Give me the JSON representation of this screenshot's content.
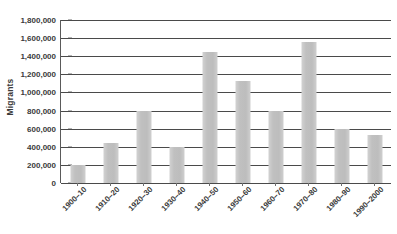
{
  "chart_data": {
    "type": "bar",
    "title": "",
    "xlabel": "",
    "ylabel": "Migrants",
    "categories": [
      "1900–10",
      "1910–20",
      "1920–30",
      "1930–40",
      "1940–50",
      "1950–60",
      "1960–70",
      "1970–80",
      "1980–90",
      "1990–2000"
    ],
    "values": [
      200000,
      440000,
      800000,
      400000,
      1450000,
      1130000,
      800000,
      1560000,
      600000,
      530000
    ],
    "ylim": [
      0,
      1800000
    ],
    "ytick_values": [
      0,
      200000,
      400000,
      600000,
      800000,
      1000000,
      1200000,
      1400000,
      1600000,
      1800000
    ],
    "ytick_labels": [
      "0",
      "200,000",
      "400,000",
      "600,000",
      "800,000",
      "1,000,000",
      "1,200,000",
      "1,400,000",
      "1,600,000",
      "1,800,000"
    ],
    "grid": true,
    "legend": false,
    "legend_position": "none",
    "bar_color": "#c2c2c2",
    "axis_color": "#4a4a4a",
    "text_color": "#3a3a3a",
    "background": "#ffffff"
  }
}
